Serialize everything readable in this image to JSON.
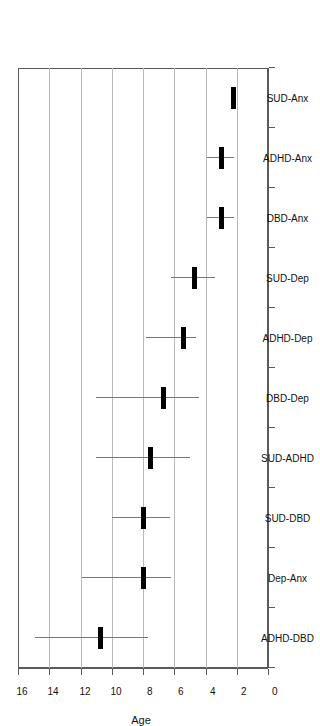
{
  "chart_data": {
    "type": "scatter",
    "title": "",
    "xlabel": "",
    "ylabel": "Age",
    "ylim": [
      0,
      16
    ],
    "yticks": [
      0,
      2,
      4,
      6,
      8,
      10,
      12,
      14,
      16
    ],
    "ytick_labels": [
      "0",
      "2",
      "4",
      "6",
      "8",
      "10",
      "12",
      "14",
      "16"
    ],
    "grid": true,
    "grid_axis": "y",
    "orientation": "rotated-90",
    "legend": "none",
    "categories": [
      "ADHD-DBD",
      "Dep-Anx",
      "SUD-DBD",
      "SUD-ADHD",
      "DBD-Dep",
      "ADHD-Dep",
      "SUD-Dep",
      "DBD-Anx",
      "ADHD-Anx",
      "SUD-Anx"
    ],
    "values": [
      10.75,
      8.0,
      8.0,
      7.5,
      6.7,
      5.4,
      4.7,
      3.0,
      3.0,
      2.2
    ],
    "error_low": [
      7.7,
      6.2,
      6.3,
      5.0,
      4.4,
      4.6,
      3.4,
      2.2,
      2.2,
      2.1
    ],
    "error_high": [
      14.9,
      11.9,
      10.0,
      11.0,
      11.0,
      7.8,
      6.2,
      3.9,
      3.9,
      2.4
    ],
    "series": [
      {
        "name": "Age at onset",
        "values": [
          10.75,
          8.0,
          8.0,
          7.5,
          6.7,
          5.4,
          4.7,
          3.0,
          3.0,
          2.2
        ]
      }
    ]
  },
  "axis": {
    "value_axis_title": "Age",
    "value_axis_min": 0,
    "value_axis_max": 16
  }
}
